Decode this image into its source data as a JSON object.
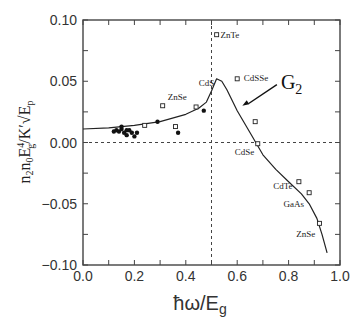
{
  "chart_data": {
    "type": "scatter",
    "title": "",
    "xlabel": "ħω/E_g",
    "ylabel": "n₂n₀E_g⁴/K′√E_p",
    "xlim": [
      0.0,
      1.0
    ],
    "ylim": [
      -0.1,
      0.1
    ],
    "x_ticks": [
      "0.0",
      "0.2",
      "0.4",
      "0.6",
      "0.8",
      "1.0"
    ],
    "y_ticks": [
      "0.10",
      "0.05",
      "0.00",
      "-0.05",
      "-0.10"
    ],
    "grid": false,
    "reference_lines": {
      "horizontal_dashed_y": 0.0,
      "vertical_dashed_x": 0.5
    },
    "curve": {
      "name": "G2",
      "x": [
        0.0,
        0.1,
        0.2,
        0.3,
        0.4,
        0.45,
        0.48,
        0.5,
        0.52,
        0.54,
        0.56,
        0.6,
        0.65,
        0.7,
        0.75,
        0.8,
        0.85,
        0.88,
        0.91,
        0.93,
        0.95
      ],
      "y": [
        0.011,
        0.012,
        0.014,
        0.017,
        0.023,
        0.028,
        0.033,
        0.042,
        0.052,
        0.05,
        0.043,
        0.026,
        0.008,
        -0.01,
        -0.022,
        -0.032,
        -0.042,
        -0.05,
        -0.062,
        -0.075,
        -0.09
      ]
    },
    "series": [
      {
        "name": "filled-circles",
        "marker": "filled-circle",
        "points": [
          [
            0.12,
            0.009
          ],
          [
            0.13,
            0.01
          ],
          [
            0.14,
            0.009
          ],
          [
            0.15,
            0.011
          ],
          [
            0.15,
            0.013
          ],
          [
            0.16,
            0.008
          ],
          [
            0.17,
            0.01
          ],
          [
            0.17,
            0.006
          ],
          [
            0.18,
            0.01
          ],
          [
            0.19,
            0.008
          ],
          [
            0.2,
            0.005
          ],
          [
            0.21,
            0.008
          ],
          [
            0.29,
            0.017
          ],
          [
            0.37,
            0.008
          ],
          [
            0.47,
            0.026
          ]
        ]
      },
      {
        "name": "open-squares",
        "marker": "open-square",
        "points": [
          [
            0.24,
            0.014
          ],
          [
            0.31,
            0.03
          ],
          [
            0.36,
            0.013
          ],
          [
            0.44,
            0.029
          ],
          [
            0.52,
            0.088
          ],
          [
            0.6,
            0.052
          ],
          [
            0.67,
            0.017
          ],
          [
            0.68,
            -0.001
          ],
          [
            0.84,
            -0.032
          ],
          [
            0.88,
            -0.041
          ],
          [
            0.92,
            -0.066
          ]
        ]
      }
    ],
    "annotations": [
      {
        "text": "ZnTe",
        "x": 0.535,
        "y": 0.085
      },
      {
        "text": "CdS",
        "x": 0.45,
        "y": 0.046
      },
      {
        "text": "CdSSe",
        "x": 0.625,
        "y": 0.05
      },
      {
        "text": "ZnSe",
        "x": 0.33,
        "y": 0.035
      },
      {
        "text": "CdSe",
        "x": 0.59,
        "y": -0.01
      },
      {
        "text": "CdTe",
        "x": 0.74,
        "y": -0.038
      },
      {
        "text": "GaAs",
        "x": 0.78,
        "y": -0.053
      },
      {
        "text": "ZnSe",
        "x": 0.83,
        "y": -0.077
      },
      {
        "text": "G₂",
        "x": 0.77,
        "y": 0.044,
        "arrow_to": [
          0.62,
          0.03
        ]
      }
    ]
  },
  "labels": {
    "x_title_main": "ħω/E",
    "x_title_sub": "g",
    "y_title": "n₂n₀E⁴g/K′√Ep",
    "g2_main": "G",
    "g2_sub": "2"
  }
}
